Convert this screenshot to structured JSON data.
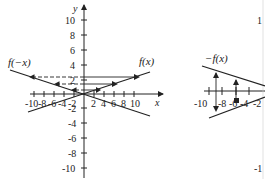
{
  "left_graph": {
    "x_axis_label": "x",
    "y_axis_label": "y",
    "x_ticks": [
      "-10",
      "-8",
      "-6",
      "-4",
      "-2",
      "2",
      "4",
      "6",
      "8",
      "10"
    ],
    "y_ticks_pos": [
      "10",
      "8",
      "6",
      "4",
      "2"
    ],
    "y_ticks_neg": [
      "-2",
      "-4",
      "-6",
      "-8",
      "-10"
    ],
    "curve_labels": {
      "original": "f(x)",
      "reflected": "f(−x)"
    },
    "reflection": "across y-axis"
  },
  "right_graph": {
    "x_ticks_visible": [
      "-10",
      "-8",
      "-6",
      "-4",
      "-2"
    ],
    "y_ticks_visible": [
      "1",
      "-",
      "-",
      "-",
      "-1"
    ],
    "curve_labels": {
      "reflected": "−f(x)"
    },
    "reflection": "across x-axis"
  },
  "colors": {
    "line": "#222222",
    "background": "#ffffff"
  }
}
